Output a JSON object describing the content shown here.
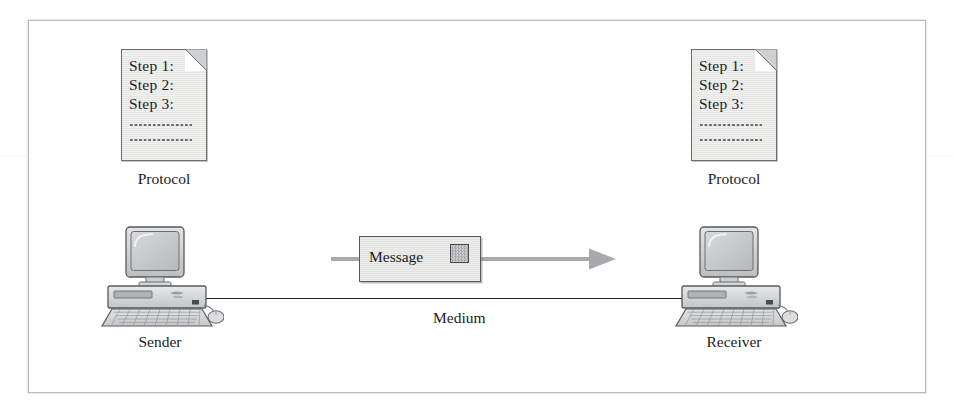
{
  "figure": {
    "background_color": "#ffffff",
    "frame_color": "#b9bbbd"
  },
  "colors": {
    "line": "#231f20",
    "arrow": "#a7a9ac",
    "document_fill": "#e9e9e7",
    "document_border": "#6d6e70",
    "envelope_fill": "#e5e5e3",
    "envelope_border": "#58595b",
    "text": "#1b1b1b"
  },
  "documents": [
    {
      "id": "sender-protocol",
      "steps": [
        "Step 1:",
        "Step 2:",
        "Step 3:"
      ],
      "dotted_rows": 2,
      "caption": "Protocol",
      "icon": "document-folded-corner-icon"
    },
    {
      "id": "receiver-protocol",
      "steps": [
        "Step 1:",
        "Step 2:",
        "Step 3:"
      ],
      "dotted_rows": 2,
      "caption": "Protocol",
      "icon": "document-folded-corner-icon"
    }
  ],
  "computers": [
    {
      "id": "sender",
      "caption": "Sender",
      "icon": "desktop-computer-icon"
    },
    {
      "id": "receiver",
      "caption": "Receiver",
      "icon": "desktop-computer-icon"
    }
  ],
  "medium": {
    "label": "Medium",
    "icon": "horizontal-line-icon"
  },
  "message": {
    "label": "Message",
    "stamp_icon": "stamp-square-icon",
    "arrow_icon": "arrow-right-icon",
    "direction": "left-to-right"
  }
}
